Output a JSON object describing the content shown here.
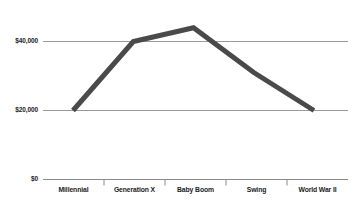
{
  "chart_data": {
    "type": "line",
    "title": "",
    "subtitle": "",
    "xlabel": "",
    "ylabel": "",
    "categories": [
      "Millennial",
      "Generation X",
      "Baby Boom",
      "Swing",
      "World War II"
    ],
    "values": [
      20000,
      40000,
      44000,
      31000,
      20000
    ],
    "series": [
      {
        "name": "Median income",
        "values": [
          20000,
          40000,
          44000,
          31000,
          20000
        ]
      }
    ],
    "ylim": [
      0,
      50000
    ],
    "ytick_labels": [
      "$0",
      "$20,000",
      "$40,000"
    ],
    "ytick_values": [
      0,
      20000,
      40000
    ],
    "grid": true,
    "gridlines": [
      "$20,000",
      "$40,000"
    ],
    "legend": "none",
    "line_color": "#4a4a4a",
    "grid_color": "#9a9a9a",
    "axis_color": "#8a8a8a",
    "background_color": "#ffffff",
    "line_width": 5
  },
  "axis": {
    "y_labels": {
      "zero": "$0",
      "twenty_thousand": "$20,000",
      "forty_thousand": "$40,000"
    },
    "x_labels": {
      "millennial": "Millennial",
      "generation_x": "Generation X",
      "baby_boom": "Baby Boom",
      "swing": "Swing",
      "world_war_ii": "World War II"
    }
  }
}
